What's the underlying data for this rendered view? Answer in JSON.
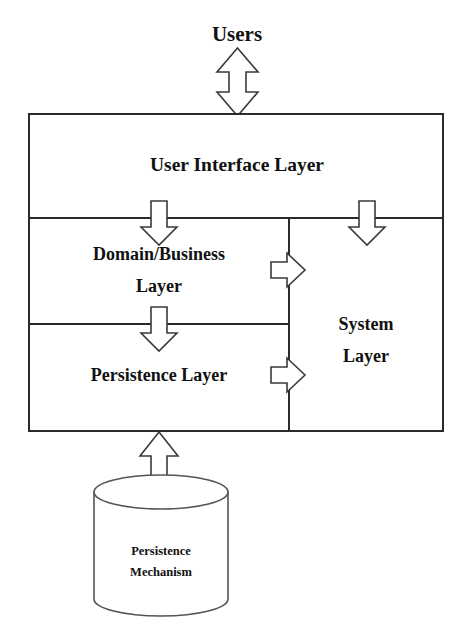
{
  "diagram": {
    "type": "layered-architecture-diagram",
    "background_color": "#ffffff",
    "line_color": "#2b2b2b",
    "text_color": "#111111",
    "arrow_fill": "#ffffff",
    "arrow_stroke": "#3a3a3a",
    "cylinder_stroke": "#555555"
  },
  "actor": {
    "label": "Users"
  },
  "layers": {
    "ui": {
      "label": "User Interface Layer"
    },
    "domain": {
      "label_line1": "Domain/Business",
      "label_line2": "Layer"
    },
    "persistence": {
      "label": "Persistence Layer"
    },
    "system": {
      "label_line1": "System",
      "label_line2": "Layer"
    }
  },
  "store": {
    "label_line1": "Persistence",
    "label_line2": "Mechanism"
  },
  "connectors": [
    {
      "name": "users-to-ui",
      "from": "Users",
      "to": "User Interface Layer",
      "direction": "bidirectional",
      "orientation": "vertical"
    },
    {
      "name": "ui-to-domain",
      "from": "User Interface Layer",
      "to": "Domain/Business Layer",
      "direction": "down",
      "orientation": "vertical"
    },
    {
      "name": "ui-to-system",
      "from": "User Interface Layer",
      "to": "System Layer",
      "direction": "down",
      "orientation": "vertical"
    },
    {
      "name": "domain-to-persistence",
      "from": "Domain/Business Layer",
      "to": "Persistence Layer",
      "direction": "down",
      "orientation": "vertical"
    },
    {
      "name": "domain-to-system",
      "from": "Domain/Business Layer",
      "to": "System Layer",
      "direction": "right",
      "orientation": "horizontal"
    },
    {
      "name": "persistence-to-system",
      "from": "Persistence Layer",
      "to": "System Layer",
      "direction": "right",
      "orientation": "horizontal"
    },
    {
      "name": "persistence-to-mechanism",
      "from": "Persistence Layer",
      "to": "Persistence Mechanism",
      "direction": "bidirectional",
      "orientation": "vertical"
    }
  ]
}
